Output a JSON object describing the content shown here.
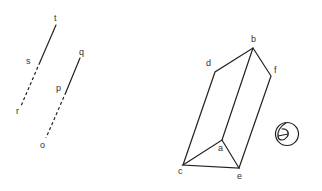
{
  "labels": {
    "t": "t",
    "s": "s",
    "r": "r",
    "q": "q",
    "p": "p",
    "o": "o",
    "b": "b",
    "d": "d",
    "f": "f",
    "a": "a",
    "c": "c",
    "e": "e"
  },
  "colors": {
    "stroke": "#222222",
    "text": "#333333",
    "background": "#ffffff"
  }
}
